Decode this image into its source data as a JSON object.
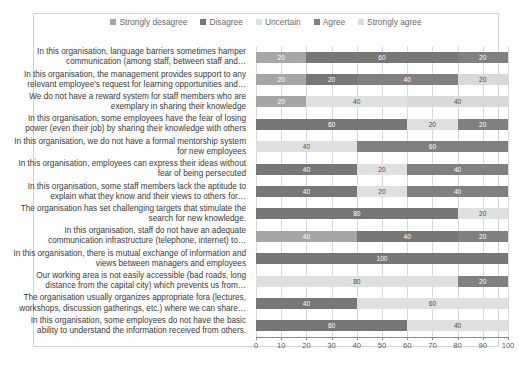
{
  "chart_data": {
    "type": "bar",
    "subtype": "stacked-horizontal-bar",
    "title": "",
    "xlabel": "",
    "ylabel": "",
    "xlim": [
      0,
      100
    ],
    "xticks": [
      0,
      10,
      20,
      30,
      40,
      50,
      60,
      70,
      80,
      90,
      100
    ],
    "grid": true,
    "legend_position": "top-center",
    "categories": [
      "In this organisation, language barriers sometimes hamper communication (among staff, between staff and…",
      "In this organisation, the management provides support to any relevant employee's request for learning opportunities and…",
      "We do not have a reward system for staff members who are exemplary in sharing their knowledge",
      "In this organisation, some employees have the fear of losing power (even their job) by sharing their knowledge with others",
      "In this organisation, we do not have a formal mentorship system for new employees",
      "In this organisation, employees can express their ideas without fear of being persecuted",
      "In this organisation, some staff members lack the aptitude to explain what they know and their views to others for…",
      "The organisation has set challenging targets that stimulate the search for new knowledge.",
      "In this organisation, staff do not have an adequate communication infrastructure (telephone, internet) to…",
      "In this organisation, there is mutual exchange of information and views between managers and employees",
      "Our working area is not easily accessible (bad roads, long distance from the capital city) which prevents us from…",
      "The organisation usually organizes appropriate fora (lectures, workshops, discussion gatherings, etc.) where we can share…",
      "In this organisation, some employees do not have the basic ability to understand the information received from others."
    ],
    "series": [
      {
        "name": "Strongly desagree",
        "color": "#a6a6a6",
        "values": [
          20,
          20,
          20,
          0,
          0,
          0,
          0,
          0,
          40,
          0,
          0,
          0,
          0
        ]
      },
      {
        "name": "Disagree",
        "color": "#777777",
        "values": [
          60,
          20,
          0,
          60,
          0,
          40,
          40,
          80,
          40,
          100,
          0,
          40,
          60
        ]
      },
      {
        "name": "Uncertain",
        "color": "#e0e0e0",
        "values": [
          0,
          0,
          40,
          20,
          40,
          20,
          20,
          20,
          0,
          0,
          80,
          60,
          40
        ]
      },
      {
        "name": "Agree",
        "color": "#808080",
        "values": [
          20,
          40,
          0,
          20,
          60,
          40,
          40,
          0,
          20,
          0,
          20,
          0,
          0
        ]
      },
      {
        "name": "Strongly agree",
        "color": "#d9d9d9",
        "values": [
          0,
          20,
          40,
          0,
          0,
          0,
          0,
          0,
          0,
          0,
          0,
          0,
          0
        ]
      }
    ]
  },
  "legend": {
    "items": [
      {
        "label": "Strongly desagree"
      },
      {
        "label": "Disagree"
      },
      {
        "label": "Uncertain"
      },
      {
        "label": "Agree"
      },
      {
        "label": "Strongly agree"
      }
    ]
  }
}
